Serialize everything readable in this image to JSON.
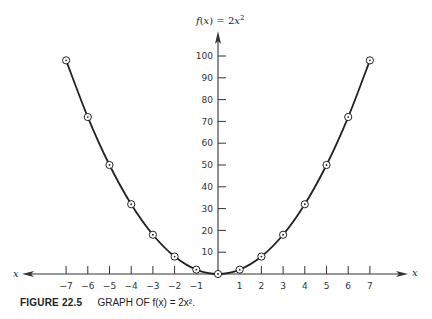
{
  "chart_data": {
    "type": "line",
    "title": "f(x) = 2x²",
    "xlabel": "x",
    "ylabel": "f(x)",
    "x": [
      -7,
      -6,
      -5,
      -4,
      -3,
      -2,
      -1,
      0,
      1,
      2,
      3,
      4,
      5,
      6,
      7
    ],
    "series": [
      {
        "name": "f(x) = 2x²",
        "values": [
          98,
          72,
          50,
          32,
          18,
          8,
          2,
          0,
          2,
          8,
          18,
          32,
          50,
          72,
          98
        ],
        "markers": "circled-dot",
        "curve": "smooth"
      }
    ],
    "x_ticks": [
      "-7",
      "-6",
      "-5",
      "-4",
      "-3",
      "-2",
      "-1",
      "1",
      "2",
      "3",
      "4",
      "5",
      "6",
      "7"
    ],
    "y_ticks": [
      "10",
      "20",
      "30",
      "40",
      "50",
      "60",
      "70",
      "80",
      "90",
      "100"
    ],
    "xlim": [
      -7.5,
      8.5
    ],
    "ylim": [
      0,
      105
    ],
    "grid": false,
    "legend": "none"
  },
  "title": {
    "fx": "f",
    "paren": "(x)",
    "eq": " = 2",
    "var": "x",
    "exp": "2"
  },
  "axis": {
    "x_left_label": "x",
    "x_right_label": "x"
  },
  "caption": {
    "figure": "FIGURE 22.5",
    "text": "GRAPH OF f(x) = 2x²."
  }
}
